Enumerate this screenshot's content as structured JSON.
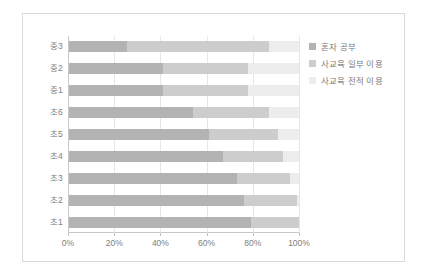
{
  "chart_data": {
    "type": "bar",
    "orientation": "horizontal",
    "stacked": true,
    "stack_mode": "percent",
    "title": "",
    "xlabel": "",
    "ylabel": "",
    "xlim": [
      0,
      100
    ],
    "grid": true,
    "legend_position": "right",
    "xticks": [
      "0%",
      "20%",
      "40%",
      "60%",
      "80%",
      "100%"
    ],
    "xtick_values": [
      0,
      20,
      40,
      60,
      80,
      100
    ],
    "categories": [
      "중3",
      "중2",
      "중1",
      "초6",
      "초5",
      "초4",
      "초3",
      "초2",
      "초1"
    ],
    "series": [
      {
        "name": "혼자 공부",
        "color": "#b3b3b3",
        "values": [
          25,
          41,
          41,
          54,
          61,
          67,
          73,
          76,
          79
        ]
      },
      {
        "name": "사교육 일부 이용",
        "color": "#cdcdcd",
        "values": [
          62,
          37,
          37,
          33,
          30,
          26,
          23,
          23,
          21
        ]
      },
      {
        "name": "사교육 전적 이용",
        "color": "#ededed",
        "values": [
          13,
          22,
          22,
          13,
          9,
          7,
          4,
          1,
          0
        ]
      }
    ]
  },
  "legend": {
    "items": [
      {
        "label": "혼자 공부",
        "color": "#b3b3b3"
      },
      {
        "label": "사교육 일부 이용",
        "color": "#cdcdcd"
      },
      {
        "label": "사교육 전적 이용",
        "color": "#ededed"
      }
    ]
  }
}
